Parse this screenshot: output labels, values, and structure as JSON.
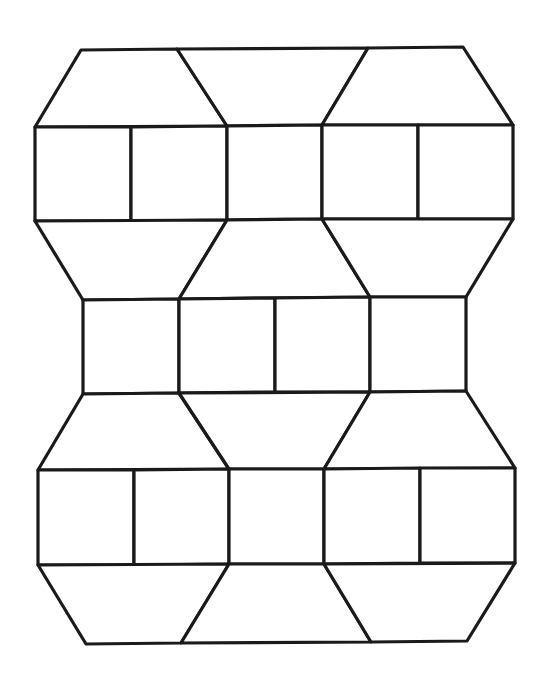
{
  "diagram": {
    "title": "",
    "background": "#ffffff",
    "stroke_color": "#1a1a1a",
    "stroke_width": 3.2,
    "vertices": {
      "A": [
        81,
        50
      ],
      "B": [
        177,
        49
      ],
      "C": [
        368,
        48
      ],
      "D": [
        463,
        47
      ],
      "E": [
        35,
        127
      ],
      "F": [
        131,
        127
      ],
      "G": [
        227,
        126
      ],
      "H": [
        322,
        125
      ],
      "I": [
        418,
        125
      ],
      "J": [
        513,
        125
      ],
      "K": [
        35,
        221
      ],
      "L": [
        131,
        221
      ],
      "M": [
        227,
        220
      ],
      "N": [
        322,
        219
      ],
      "O": [
        418,
        219
      ],
      "P": [
        513,
        219
      ],
      "Q": [
        83,
        300
      ],
      "R": [
        179,
        299
      ],
      "S": [
        275,
        298
      ],
      "T": [
        370,
        297
      ],
      "U": [
        466,
        297
      ],
      "V": [
        83,
        394
      ],
      "W": [
        179,
        393
      ],
      "X": [
        275,
        392
      ],
      "Y": [
        370,
        392
      ],
      "Z": [
        466,
        391
      ],
      "a": [
        38,
        470
      ],
      "b": [
        134,
        470
      ],
      "c": [
        229,
        469
      ],
      "d": [
        324,
        469
      ],
      "e": [
        420,
        468
      ],
      "f": [
        515,
        468
      ],
      "g": [
        38,
        565
      ],
      "h": [
        134,
        565
      ],
      "i": [
        229,
        564
      ],
      "j": [
        324,
        564
      ],
      "k": [
        420,
        563
      ],
      "l": [
        515,
        563
      ],
      "m": [
        86,
        644
      ],
      "n": [
        181,
        643
      ],
      "o": [
        371,
        642
      ],
      "p": [
        467,
        641
      ]
    },
    "shapes": [
      {
        "id": "trap-top-left",
        "kind": "trapezoid",
        "points": [
          "A",
          "B",
          "G",
          "E"
        ]
      },
      {
        "id": "trap-top-mid",
        "kind": "trapezoid",
        "points": [
          "B",
          "C",
          "H",
          "G"
        ]
      },
      {
        "id": "trap-top-right",
        "kind": "trapezoid",
        "points": [
          "C",
          "D",
          "J",
          "H"
        ]
      },
      {
        "id": "sq-r1-1",
        "kind": "square",
        "points": [
          "E",
          "F",
          "L",
          "K"
        ]
      },
      {
        "id": "sq-r1-2",
        "kind": "square",
        "points": [
          "F",
          "G",
          "M",
          "L"
        ]
      },
      {
        "id": "sq-r1-3",
        "kind": "square",
        "points": [
          "G",
          "H",
          "N",
          "M"
        ]
      },
      {
        "id": "sq-r1-4",
        "kind": "square",
        "points": [
          "H",
          "I",
          "O",
          "N"
        ]
      },
      {
        "id": "sq-r1-5",
        "kind": "square",
        "points": [
          "I",
          "J",
          "P",
          "O"
        ]
      },
      {
        "id": "trap-r2-left",
        "kind": "trapezoid",
        "points": [
          "K",
          "M",
          "R",
          "Q"
        ]
      },
      {
        "id": "trap-r2-mid",
        "kind": "trapezoid",
        "points": [
          "M",
          "N",
          "T",
          "R"
        ]
      },
      {
        "id": "trap-r2-right",
        "kind": "trapezoid",
        "points": [
          "N",
          "P",
          "U",
          "T"
        ]
      },
      {
        "id": "sq-r2-1",
        "kind": "square",
        "points": [
          "Q",
          "R",
          "W",
          "V"
        ]
      },
      {
        "id": "sq-r2-2",
        "kind": "square",
        "points": [
          "R",
          "S",
          "X",
          "W"
        ]
      },
      {
        "id": "sq-r2-3",
        "kind": "square",
        "points": [
          "S",
          "T",
          "Y",
          "X"
        ]
      },
      {
        "id": "sq-r2-4",
        "kind": "square",
        "points": [
          "T",
          "U",
          "Z",
          "Y"
        ]
      },
      {
        "id": "trap-r3-left",
        "kind": "trapezoid",
        "points": [
          "V",
          "W",
          "c",
          "a"
        ]
      },
      {
        "id": "trap-r3-mid",
        "kind": "trapezoid",
        "points": [
          "W",
          "Y",
          "d",
          "c"
        ]
      },
      {
        "id": "trap-r3-right",
        "kind": "trapezoid",
        "points": [
          "Y",
          "Z",
          "f",
          "d"
        ]
      },
      {
        "id": "sq-r3-1",
        "kind": "square",
        "points": [
          "a",
          "b",
          "h",
          "g"
        ]
      },
      {
        "id": "sq-r3-2",
        "kind": "square",
        "points": [
          "b",
          "c",
          "i",
          "h"
        ]
      },
      {
        "id": "sq-r3-3",
        "kind": "square",
        "points": [
          "c",
          "d",
          "j",
          "i"
        ]
      },
      {
        "id": "sq-r3-4",
        "kind": "square",
        "points": [
          "d",
          "e",
          "k",
          "j"
        ]
      },
      {
        "id": "sq-r3-5",
        "kind": "square",
        "points": [
          "e",
          "f",
          "l",
          "k"
        ]
      },
      {
        "id": "trap-bottom-left",
        "kind": "trapezoid",
        "points": [
          "g",
          "i",
          "n",
          "m"
        ]
      },
      {
        "id": "trap-bottom-mid",
        "kind": "trapezoid",
        "points": [
          "i",
          "j",
          "o",
          "n"
        ]
      },
      {
        "id": "trap-bottom-right",
        "kind": "trapezoid",
        "points": [
          "j",
          "l",
          "p",
          "o"
        ]
      }
    ],
    "counts": {
      "squares": 14,
      "trapezoids": 12
    }
  }
}
